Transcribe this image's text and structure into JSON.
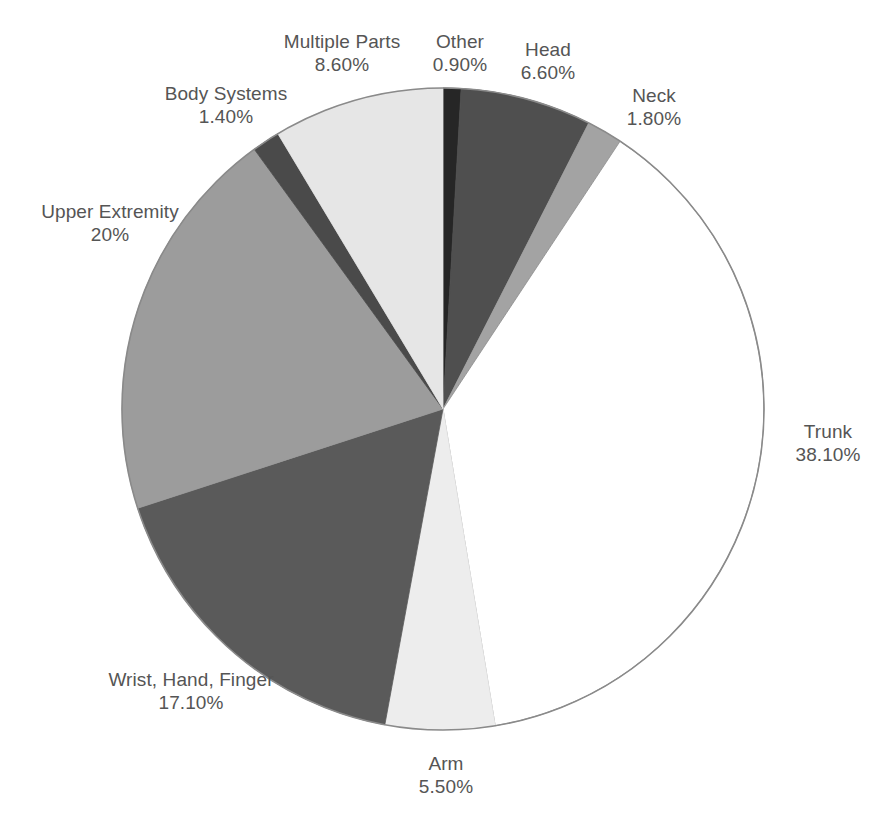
{
  "chart_data": {
    "type": "pie",
    "title": "",
    "subtitle": "",
    "xlabel": "",
    "ylabel": "",
    "legend_position": "none",
    "grid": false,
    "labels_show_percent": true,
    "start_angle_deg": 0,
    "direction": "clockwise",
    "categories": [
      "Other",
      "Head",
      "Neck",
      "Trunk",
      "Arm",
      "Wrist, Hand, Finger",
      "Upper Extremity",
      "Body Systems",
      "Multiple Parts"
    ],
    "values": [
      0.9,
      6.6,
      1.8,
      38.1,
      5.5,
      17.1,
      20,
      1.4,
      8.6
    ],
    "value_labels": [
      "0.90%",
      "6.60%",
      "1.80%",
      "38.10%",
      "5.50%",
      "17.10%",
      "20%",
      "1.40%",
      "8.60%"
    ],
    "slice_colors": [
      "#262626",
      "#4f4f4f",
      "#a3a3a3",
      "#ffffff",
      "#ededed",
      "#5a5a5a",
      "#9c9c9c",
      "#4a4a4a",
      "#e6e6e6"
    ],
    "outline_color": "#8a8a8a"
  },
  "slices": [
    {
      "name": "Other",
      "value_label": "0.90%",
      "color": "#262626"
    },
    {
      "name": "Head",
      "value_label": "6.60%",
      "color": "#4f4f4f"
    },
    {
      "name": "Neck",
      "value_label": "1.80%",
      "color": "#a3a3a3"
    },
    {
      "name": "Trunk",
      "value_label": "38.10%",
      "color": "#ffffff"
    },
    {
      "name": "Arm",
      "value_label": "5.50%",
      "color": "#ededed"
    },
    {
      "name": "Wrist, Hand, Finger",
      "value_label": "17.10%",
      "color": "#5a5a5a"
    },
    {
      "name": "Upper Extremity",
      "value_label": "20%",
      "color": "#9c9c9c"
    },
    {
      "name": "Body Systems",
      "value_label": "1.40%",
      "color": "#4a4a4a"
    },
    {
      "name": "Multiple Parts",
      "value_label": "8.60%",
      "color": "#e6e6e6"
    }
  ]
}
